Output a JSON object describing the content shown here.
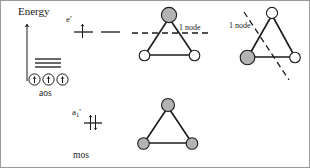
{
  "figure": {
    "axis": {
      "energy_label": "Energy",
      "direction": "up"
    },
    "labels": {
      "aos": "aos",
      "mos": "mos",
      "e_prime": "e'",
      "a1_prime_base": "a",
      "a1_prime_sub": "1",
      "a1_prime_prime": "'",
      "node_top_center": "1 node",
      "node_top_right": "1 node"
    },
    "colors": {
      "ink": "#1a1a1a",
      "shaded_lobe": "#b3b3b3",
      "empty_lobe": "#ffffff",
      "background": "#ffffff",
      "border": "#9a9a9a"
    },
    "atomic_orbitals": {
      "label": "aos",
      "count": 3,
      "electrons_each": 1,
      "degenerate_lines": 3
    },
    "molecular_orbitals": [
      {
        "symmetry": "e'",
        "level": "antibonding",
        "degeneracy": 2,
        "electrons": 1,
        "nodes": 1,
        "diagrams": [
          {
            "name": "e-prime-horizontal-node",
            "node_label": "1 node",
            "node_orientation": "horizontal",
            "vertices": [
              {
                "position": "top",
                "phase": "shaded"
              },
              {
                "position": "bottom-left",
                "phase": "empty"
              },
              {
                "position": "bottom-right",
                "phase": "empty"
              }
            ]
          },
          {
            "name": "e-prime-diagonal-node",
            "node_label": "1 node",
            "node_orientation": "diagonal",
            "vertices": [
              {
                "position": "top",
                "phase": "empty"
              },
              {
                "position": "bottom-left",
                "phase": "shaded"
              },
              {
                "position": "bottom-right",
                "phase": "empty"
              }
            ]
          }
        ]
      },
      {
        "symmetry": "a1'",
        "level": "bonding",
        "degeneracy": 1,
        "electrons": 2,
        "nodes": 0,
        "diagrams": [
          {
            "name": "a1-prime-all-in-phase",
            "node_label": "",
            "node_orientation": "none",
            "vertices": [
              {
                "position": "top",
                "phase": "shaded"
              },
              {
                "position": "bottom-left",
                "phase": "shaded"
              },
              {
                "position": "bottom-right",
                "phase": "shaded"
              }
            ]
          }
        ]
      }
    ]
  }
}
